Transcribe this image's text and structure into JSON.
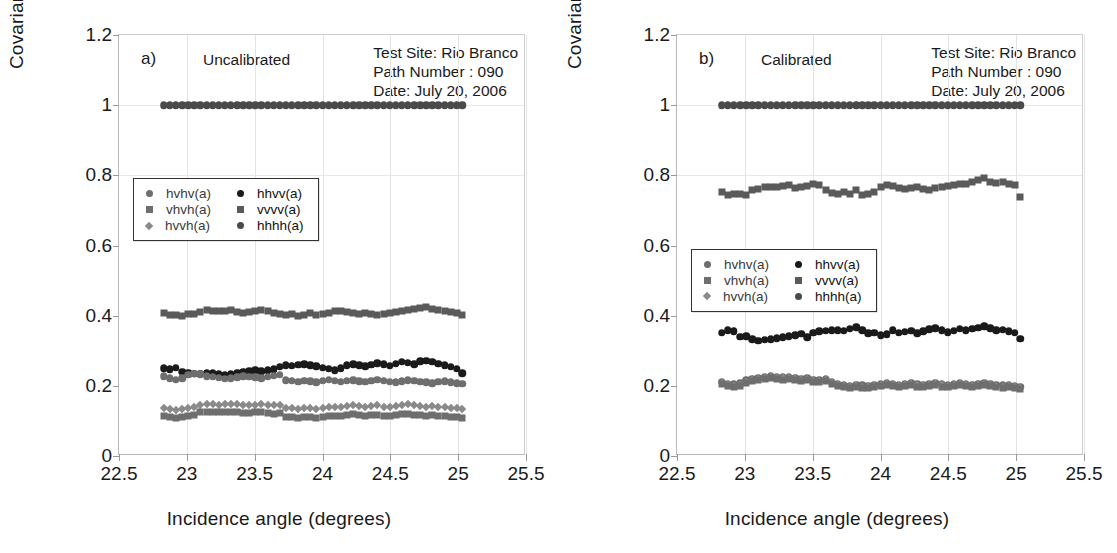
{
  "figure": {
    "width": 1117,
    "height": 553
  },
  "axes": {
    "ylabel": "Covariance",
    "xlabel": "Incidence angle (degrees)",
    "yticks": [
      "0",
      "0.2",
      "0.4",
      "0.6",
      "0.8",
      "1",
      "1.2"
    ],
    "ytick_values": [
      0,
      0.2,
      0.4,
      0.6,
      0.8,
      1.0,
      1.2
    ],
    "xticks": [
      "22.5",
      "23",
      "23.5",
      "24",
      "24.5",
      "25",
      "25.5"
    ],
    "xtick_values": [
      22.5,
      23,
      23.5,
      24,
      24.5,
      25,
      25.5
    ],
    "xlim": [
      22.5,
      25.5
    ],
    "ylim": [
      0,
      1.2
    ],
    "grid": "light gray gridlines at major ticks"
  },
  "legend": {
    "position": "inside plot, upper-left area",
    "entries": [
      {
        "label": "hvhv(a)",
        "marker": "circle",
        "color": "#6e6e6e",
        "column": "left"
      },
      {
        "label": "vhvh(a)",
        "marker": "square",
        "color": "#6e6e6e",
        "column": "left"
      },
      {
        "label": "hvvh(a)",
        "marker": "diamond",
        "color": "#8a8a8a",
        "column": "left"
      },
      {
        "label": "hhvv(a)",
        "marker": "circle",
        "color": "#1a1a1a",
        "column": "right"
      },
      {
        "label": "vvvv(a)",
        "marker": "square",
        "color": "#5a5a5a",
        "column": "right"
      },
      {
        "label": "hhhh(a)",
        "marker": "circle",
        "color": "#4a4a4a",
        "column": "right"
      }
    ]
  },
  "panels": [
    {
      "tag": "a)",
      "state": "Uncalibrated",
      "meta": {
        "test_site": "Test Site: Rio Branco",
        "path_number": "Path Number : 090",
        "date": "Date: July 20, 2006"
      }
    },
    {
      "tag": "b)",
      "state": "Calibrated",
      "meta": {
        "test_site": "Test Site: Rio Branco",
        "path_number": "Path Number : 090",
        "date": "Date: July 20, 2006"
      }
    }
  ],
  "chart_data": [
    {
      "type": "scatter",
      "panel": "a",
      "title": "Uncalibrated",
      "xlabel": "Incidence angle (degrees)",
      "ylabel": "Covariance",
      "xlim": [
        22.5,
        25.5
      ],
      "ylim": [
        0,
        1.2
      ],
      "grid": true,
      "legend_position": "upper-left inside",
      "x": [
        22.83,
        22.875,
        22.92,
        22.965,
        23.01,
        23.055,
        23.1,
        23.145,
        23.19,
        23.235,
        23.28,
        23.325,
        23.37,
        23.415,
        23.46,
        23.505,
        23.55,
        23.595,
        23.64,
        23.685,
        23.73,
        23.775,
        23.82,
        23.865,
        23.91,
        23.955,
        24.0,
        24.045,
        24.09,
        24.135,
        24.18,
        24.225,
        24.27,
        24.315,
        24.36,
        24.405,
        24.45,
        24.495,
        24.54,
        24.585,
        24.63,
        24.675,
        24.72,
        24.765,
        24.81,
        24.855,
        24.9,
        24.945,
        24.99,
        25.03
      ],
      "series": [
        {
          "name": "hhhh(a)",
          "marker": "circle",
          "color": "#4a4a4a",
          "values": [
            1.0,
            1.0,
            1.0,
            1.0,
            1.0,
            1.0,
            1.0,
            1.0,
            1.0,
            1.0,
            1.0,
            1.0,
            1.0,
            1.0,
            1.0,
            1.0,
            1.0,
            1.0,
            1.0,
            1.0,
            1.0,
            1.0,
            1.0,
            1.0,
            1.0,
            1.0,
            1.0,
            1.0,
            1.0,
            1.0,
            1.0,
            1.0,
            1.0,
            1.0,
            1.0,
            1.0,
            1.0,
            1.0,
            1.0,
            1.0,
            1.0,
            1.0,
            1.0,
            1.0,
            1.0,
            1.0,
            1.0,
            1.0,
            1.0,
            1.0
          ]
        },
        {
          "name": "vvvv(a)",
          "marker": "square",
          "color": "#5a5a5a",
          "values": [
            0.408,
            0.403,
            0.401,
            0.4,
            0.404,
            0.405,
            0.411,
            0.415,
            0.414,
            0.413,
            0.412,
            0.415,
            0.41,
            0.409,
            0.411,
            0.413,
            0.416,
            0.412,
            0.408,
            0.405,
            0.402,
            0.404,
            0.4,
            0.402,
            0.407,
            0.401,
            0.404,
            0.407,
            0.412,
            0.414,
            0.41,
            0.408,
            0.406,
            0.407,
            0.405,
            0.403,
            0.404,
            0.408,
            0.41,
            0.412,
            0.415,
            0.418,
            0.422,
            0.424,
            0.42,
            0.416,
            0.414,
            0.411,
            0.408,
            0.401
          ]
        },
        {
          "name": "hhvv(a)",
          "marker": "circle",
          "color": "#1a1a1a",
          "values": [
            0.25,
            0.247,
            0.252,
            0.24,
            0.238,
            0.235,
            0.234,
            0.238,
            0.236,
            0.233,
            0.231,
            0.234,
            0.236,
            0.24,
            0.242,
            0.244,
            0.241,
            0.244,
            0.247,
            0.255,
            0.258,
            0.257,
            0.26,
            0.262,
            0.259,
            0.256,
            0.252,
            0.249,
            0.245,
            0.25,
            0.258,
            0.262,
            0.259,
            0.256,
            0.26,
            0.264,
            0.261,
            0.257,
            0.263,
            0.268,
            0.266,
            0.262,
            0.27,
            0.272,
            0.268,
            0.263,
            0.258,
            0.254,
            0.248,
            0.236
          ]
        },
        {
          "name": "hvhv(a)",
          "marker": "circle",
          "color": "#6e6e6e",
          "values": [
            0.228,
            0.222,
            0.218,
            0.221,
            0.232,
            0.235,
            0.233,
            0.228,
            0.226,
            0.223,
            0.22,
            0.222,
            0.225,
            0.228,
            0.226,
            0.224,
            0.222,
            0.226,
            0.229,
            0.232,
            0.216,
            0.214,
            0.212,
            0.215,
            0.213,
            0.21,
            0.214,
            0.217,
            0.215,
            0.212,
            0.214,
            0.216,
            0.213,
            0.211,
            0.214,
            0.217,
            0.215,
            0.212,
            0.21,
            0.213,
            0.216,
            0.214,
            0.212,
            0.21,
            0.208,
            0.211,
            0.213,
            0.21,
            0.208,
            0.206
          ]
        },
        {
          "name": "hvvh(a)",
          "marker": "diamond",
          "color": "#8a8a8a",
          "values": [
            0.137,
            0.134,
            0.132,
            0.135,
            0.138,
            0.141,
            0.146,
            0.148,
            0.147,
            0.146,
            0.147,
            0.148,
            0.147,
            0.146,
            0.145,
            0.146,
            0.147,
            0.146,
            0.144,
            0.146,
            0.138,
            0.136,
            0.135,
            0.137,
            0.136,
            0.134,
            0.136,
            0.139,
            0.141,
            0.14,
            0.143,
            0.145,
            0.142,
            0.14,
            0.142,
            0.144,
            0.141,
            0.139,
            0.142,
            0.145,
            0.147,
            0.144,
            0.142,
            0.14,
            0.143,
            0.141,
            0.139,
            0.138,
            0.136,
            0.134
          ]
        },
        {
          "name": "vhvh(a)",
          "marker": "square",
          "color": "#6e6e6e",
          "values": [
            0.114,
            0.11,
            0.108,
            0.111,
            0.114,
            0.118,
            0.124,
            0.126,
            0.125,
            0.124,
            0.125,
            0.126,
            0.124,
            0.123,
            0.122,
            0.124,
            0.125,
            0.123,
            0.121,
            0.122,
            0.112,
            0.11,
            0.109,
            0.111,
            0.11,
            0.108,
            0.11,
            0.113,
            0.115,
            0.114,
            0.117,
            0.119,
            0.116,
            0.114,
            0.116,
            0.118,
            0.115,
            0.113,
            0.116,
            0.119,
            0.121,
            0.118,
            0.116,
            0.114,
            0.117,
            0.115,
            0.113,
            0.112,
            0.11,
            0.108
          ]
        }
      ]
    },
    {
      "type": "scatter",
      "panel": "b",
      "title": "Calibrated",
      "xlabel": "Incidence angle (degrees)",
      "ylabel": "Covariance",
      "xlim": [
        22.5,
        25.5
      ],
      "ylim": [
        0,
        1.2
      ],
      "grid": true,
      "legend_position": "middle-left inside",
      "x": [
        22.83,
        22.875,
        22.92,
        22.965,
        23.01,
        23.055,
        23.1,
        23.145,
        23.19,
        23.235,
        23.28,
        23.325,
        23.37,
        23.415,
        23.46,
        23.505,
        23.55,
        23.595,
        23.64,
        23.685,
        23.73,
        23.775,
        23.82,
        23.865,
        23.91,
        23.955,
        24.0,
        24.045,
        24.09,
        24.135,
        24.18,
        24.225,
        24.27,
        24.315,
        24.36,
        24.405,
        24.45,
        24.495,
        24.54,
        24.585,
        24.63,
        24.675,
        24.72,
        24.765,
        24.81,
        24.855,
        24.9,
        24.945,
        24.99,
        25.03
      ],
      "series": [
        {
          "name": "hhhh(a)",
          "marker": "circle",
          "color": "#4a4a4a",
          "values": [
            1.0,
            1.0,
            1.0,
            1.0,
            1.0,
            1.0,
            1.0,
            1.0,
            1.0,
            1.0,
            1.0,
            1.0,
            1.0,
            1.0,
            1.0,
            1.0,
            1.0,
            1.0,
            1.0,
            1.0,
            1.0,
            1.0,
            1.0,
            1.0,
            1.0,
            1.0,
            1.0,
            1.0,
            1.0,
            1.0,
            1.0,
            1.0,
            1.0,
            1.0,
            1.0,
            1.0,
            1.0,
            1.0,
            1.0,
            1.0,
            1.0,
            1.0,
            1.0,
            1.0,
            1.0,
            1.0,
            1.0,
            1.0,
            1.0,
            1.0
          ]
        },
        {
          "name": "vvvv(a)",
          "marker": "square",
          "color": "#5a5a5a",
          "values": [
            0.752,
            0.745,
            0.748,
            0.746,
            0.743,
            0.757,
            0.762,
            0.766,
            0.768,
            0.767,
            0.769,
            0.772,
            0.764,
            0.766,
            0.771,
            0.774,
            0.772,
            0.758,
            0.75,
            0.746,
            0.752,
            0.748,
            0.757,
            0.745,
            0.748,
            0.752,
            0.766,
            0.772,
            0.77,
            0.764,
            0.76,
            0.763,
            0.766,
            0.762,
            0.758,
            0.764,
            0.767,
            0.769,
            0.772,
            0.774,
            0.776,
            0.78,
            0.787,
            0.791,
            0.782,
            0.778,
            0.78,
            0.776,
            0.772,
            0.737
          ]
        },
        {
          "name": "hhvv(a)",
          "marker": "circle",
          "color": "#1a1a1a",
          "values": [
            0.352,
            0.358,
            0.355,
            0.34,
            0.342,
            0.333,
            0.328,
            0.331,
            0.333,
            0.336,
            0.338,
            0.341,
            0.344,
            0.348,
            0.338,
            0.352,
            0.356,
            0.357,
            0.358,
            0.359,
            0.357,
            0.362,
            0.367,
            0.358,
            0.35,
            0.352,
            0.344,
            0.347,
            0.358,
            0.352,
            0.354,
            0.357,
            0.35,
            0.356,
            0.361,
            0.364,
            0.358,
            0.353,
            0.357,
            0.362,
            0.359,
            0.362,
            0.366,
            0.37,
            0.364,
            0.358,
            0.36,
            0.356,
            0.351,
            0.334
          ]
        },
        {
          "name": "hvhv(a)",
          "marker": "circle",
          "color": "#6e6e6e",
          "values": [
            0.212,
            0.206,
            0.204,
            0.207,
            0.216,
            0.22,
            0.222,
            0.225,
            0.228,
            0.226,
            0.224,
            0.226,
            0.223,
            0.22,
            0.222,
            0.218,
            0.216,
            0.22,
            0.212,
            0.205,
            0.202,
            0.2,
            0.203,
            0.201,
            0.199,
            0.202,
            0.205,
            0.208,
            0.206,
            0.203,
            0.205,
            0.207,
            0.204,
            0.202,
            0.205,
            0.207,
            0.204,
            0.202,
            0.206,
            0.208,
            0.205,
            0.203,
            0.206,
            0.208,
            0.205,
            0.203,
            0.201,
            0.203,
            0.2,
            0.198
          ]
        },
        {
          "name": "hvvh(a)",
          "marker": "diamond",
          "color": "#8a8a8a",
          "values": [
            0.208,
            0.202,
            0.2,
            0.203,
            0.212,
            0.217,
            0.219,
            0.222,
            0.225,
            0.223,
            0.221,
            0.223,
            0.22,
            0.217,
            0.219,
            0.215,
            0.213,
            0.217,
            0.209,
            0.202,
            0.199,
            0.197,
            0.2,
            0.198,
            0.196,
            0.199,
            0.202,
            0.205,
            0.203,
            0.2,
            0.202,
            0.204,
            0.201,
            0.199,
            0.202,
            0.204,
            0.201,
            0.199,
            0.203,
            0.205,
            0.202,
            0.2,
            0.203,
            0.205,
            0.202,
            0.2,
            0.198,
            0.2,
            0.197,
            0.195
          ]
        },
        {
          "name": "vhvh(a)",
          "marker": "square",
          "color": "#6e6e6e",
          "values": [
            0.205,
            0.199,
            0.197,
            0.2,
            0.209,
            0.214,
            0.216,
            0.219,
            0.222,
            0.22,
            0.218,
            0.22,
            0.217,
            0.214,
            0.216,
            0.212,
            0.21,
            0.214,
            0.206,
            0.199,
            0.196,
            0.194,
            0.197,
            0.195,
            0.193,
            0.196,
            0.199,
            0.202,
            0.2,
            0.197,
            0.199,
            0.201,
            0.198,
            0.196,
            0.199,
            0.201,
            0.198,
            0.196,
            0.2,
            0.202,
            0.199,
            0.197,
            0.2,
            0.202,
            0.199,
            0.197,
            0.195,
            0.197,
            0.194,
            0.192
          ]
        }
      ]
    }
  ]
}
